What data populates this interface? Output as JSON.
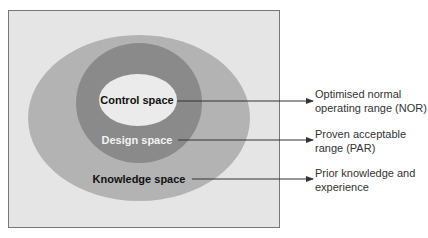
{
  "diagram": {
    "regions": [
      {
        "id": "knowledge",
        "label": "Knowledge space",
        "description": [
          "Prior knowledge and",
          "experience"
        ],
        "color": "#b3b3b3",
        "text_color": "#111111"
      },
      {
        "id": "design",
        "label": "Design space",
        "description": [
          "Proven acceptable",
          "range (PAR)"
        ],
        "color": "#8a8a8a",
        "text_color": "#f2f2f2"
      },
      {
        "id": "control",
        "label": "Control space",
        "description": [
          "Optimised normal",
          "operating range (NOR)"
        ],
        "color": "#ebebeb",
        "text_color": "#111111"
      }
    ],
    "frame_color": "#e5e5e5",
    "line_color": "#333333"
  }
}
